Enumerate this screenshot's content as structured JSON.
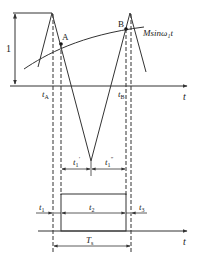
{
  "diagram": {
    "type": "timing-waveform",
    "upper_axis_label": "t",
    "lower_axis_label": "t",
    "amplitude_label": "1",
    "curve_label": "Msinω₁t",
    "point_a_label": "A",
    "point_b_label": "B",
    "t_a_label": "t",
    "t_a_sub": "A",
    "t_b_label": "t",
    "t_b_sub": "B",
    "t1_prime_label": "t",
    "t1_prime_sub": "1",
    "t1_prime_sup": "′",
    "t1_dprime_label": "t",
    "t1_dprime_sub": "1",
    "t1_dprime_sup": "″",
    "t1_label": "t",
    "t1_sub": "1",
    "t2_label": "t",
    "t2_sub": "2",
    "t3_label": "t",
    "t3_sub": "3",
    "ts_label": "T",
    "ts_sub": "s",
    "colors": {
      "line": "#333333",
      "background": "#ffffff"
    }
  }
}
